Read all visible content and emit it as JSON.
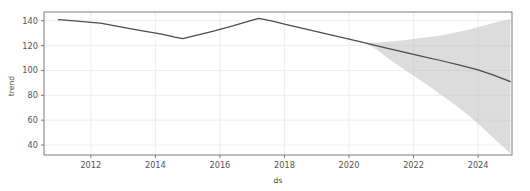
{
  "chart_data": {
    "type": "line",
    "title": "",
    "xlabel": "ds",
    "ylabel": "trend",
    "xlim": [
      2010.55,
      2025.05
    ],
    "ylim": [
      32.0,
      147.0
    ],
    "grid": true,
    "legend": "none",
    "xticks": [
      2012,
      2014,
      2016,
      2018,
      2020,
      2022,
      2024
    ],
    "xtick_labels": [
      "2012",
      "2014",
      "2016",
      "2018",
      "2020",
      "2022",
      "2024"
    ],
    "yticks": [
      40,
      60,
      80,
      100,
      120,
      140
    ],
    "ytick_labels": [
      "40",
      "60",
      "80",
      "100",
      "120",
      "140"
    ],
    "series": [
      {
        "name": "trend",
        "color": "#4d4d4d",
        "x": [
          2011.0,
          2011.5,
          2012.0,
          2012.3,
          2013.0,
          2013.6,
          2014.2,
          2014.6,
          2014.85,
          2015.2,
          2015.8,
          2016.4,
          2016.9,
          2017.2,
          2017.6,
          2018.0,
          2018.6,
          2019.2,
          2019.8,
          2020.4,
          2021.0,
          2021.6,
          2022.2,
          2022.8,
          2023.4,
          2024.0,
          2024.5,
          2025.0
        ],
        "values": [
          140.8,
          139.8,
          138.6,
          138.0,
          134.6,
          131.8,
          129.2,
          126.8,
          125.5,
          127.8,
          131.6,
          135.8,
          139.6,
          141.9,
          139.8,
          137.2,
          133.6,
          130.0,
          126.4,
          122.8,
          119.0,
          115.4,
          111.8,
          108.2,
          104.4,
          100.4,
          96.0,
          91.0
        ]
      }
    ],
    "uncertainty_band": {
      "name": "trend uncertainty interval",
      "color": "#bfbfbf",
      "opacity": 0.55,
      "x": [
        2020.5,
        2020.9,
        2021.3,
        2021.7,
        2022.1,
        2022.5,
        2022.9,
        2023.3,
        2023.7,
        2024.1,
        2024.5,
        2024.8,
        2025.0
      ],
      "upper": [
        122.5,
        122.2,
        123.2,
        124.2,
        125.6,
        126.8,
        128.4,
        130.6,
        132.8,
        135.6,
        138.4,
        140.2,
        141.2
      ],
      "lower": [
        122.0,
        116.0,
        108.0,
        101.0,
        94.0,
        87.0,
        79.5,
        72.0,
        64.0,
        55.0,
        45.0,
        38.0,
        33.0
      ]
    }
  },
  "axes": {
    "ylabel": "trend",
    "xlabel": "ds"
  }
}
